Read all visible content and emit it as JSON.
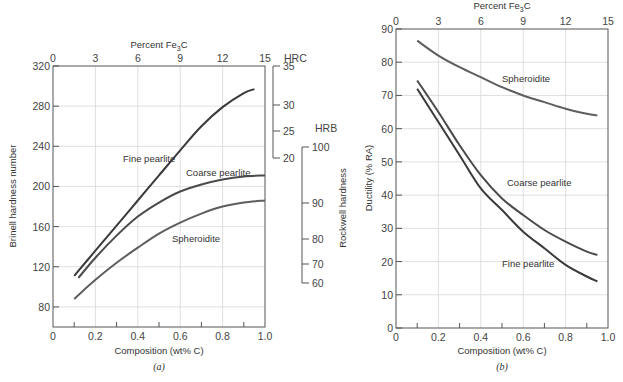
{
  "chart_data": [
    {
      "id": "a",
      "type": "line",
      "panel_label": "(a)",
      "title": "",
      "xlabel": "Composition (wt% C)",
      "ylabel": "Brinell hardness number",
      "top_xlabel": "Percent Fe3C",
      "right_ylabel": "Rockwell hardness",
      "xlim": [
        0,
        1.0
      ],
      "ylim": [
        60,
        320
      ],
      "x_ticks": [
        "0",
        "0.2",
        "0.4",
        "0.6",
        "0.8",
        "1.0"
      ],
      "y_ticks": [
        "80",
        "120",
        "160",
        "200",
        "240",
        "280",
        "320"
      ],
      "top_ticks": [
        "0",
        "3",
        "6",
        "9",
        "12",
        "15"
      ],
      "hrc_scale": {
        "label": "HRC",
        "ticks": [
          "35",
          "30",
          "25",
          "20"
        ]
      },
      "hrb_scale": {
        "label": "HRB",
        "ticks": [
          "100",
          "90",
          "80",
          "70",
          "60"
        ]
      },
      "grid": true,
      "series": [
        {
          "name": "Fine pearlite",
          "x": [
            0.1,
            0.2,
            0.3,
            0.4,
            0.5,
            0.6,
            0.7,
            0.8,
            0.9,
            0.95
          ],
          "values": [
            111,
            136,
            161,
            186,
            211,
            236,
            260,
            279,
            293,
            297
          ]
        },
        {
          "name": "Coarse pearlite",
          "x": [
            0.12,
            0.2,
            0.3,
            0.4,
            0.5,
            0.6,
            0.7,
            0.8,
            0.9,
            1.0
          ],
          "values": [
            109,
            129,
            151,
            170,
            184,
            195,
            202,
            207,
            210,
            211
          ]
        },
        {
          "name": "Spheroidite",
          "x": [
            0.1,
            0.2,
            0.3,
            0.4,
            0.5,
            0.6,
            0.7,
            0.8,
            0.9,
            1.0
          ],
          "values": [
            88,
            107,
            124,
            139,
            153,
            164,
            173,
            180,
            184,
            186
          ]
        }
      ]
    },
    {
      "id": "b",
      "type": "line",
      "panel_label": "(b)",
      "title": "",
      "xlabel": "Composition (wt% C)",
      "ylabel": "Ductility (% RA)",
      "top_xlabel": "Percent Fe3C",
      "xlim": [
        0,
        1.0
      ],
      "ylim": [
        0,
        90
      ],
      "x_ticks": [
        "0",
        "0.2",
        "0.4",
        "0.6",
        "0.8",
        "1.0"
      ],
      "y_ticks": [
        "0",
        "10",
        "20",
        "30",
        "40",
        "50",
        "60",
        "70",
        "80",
        "90"
      ],
      "top_ticks": [
        "0",
        "3",
        "6",
        "9",
        "12",
        "15"
      ],
      "grid": true,
      "series": [
        {
          "name": "Spheroidite",
          "x": [
            0.1,
            0.2,
            0.3,
            0.4,
            0.5,
            0.6,
            0.7,
            0.8,
            0.9,
            0.95
          ],
          "values": [
            86.5,
            82,
            78.5,
            75.5,
            72.5,
            70,
            68,
            66,
            64.5,
            64
          ]
        },
        {
          "name": "Coarse pearlite",
          "x": [
            0.1,
            0.2,
            0.3,
            0.4,
            0.5,
            0.6,
            0.7,
            0.8,
            0.9,
            0.95
          ],
          "values": [
            74.5,
            65,
            55,
            46,
            39,
            34,
            29.5,
            26,
            23,
            22
          ]
        },
        {
          "name": "Fine pearlite",
          "x": [
            0.1,
            0.2,
            0.3,
            0.4,
            0.5,
            0.6,
            0.7,
            0.8,
            0.9,
            0.95
          ],
          "values": [
            72,
            62,
            52,
            42,
            35.5,
            29,
            24,
            19,
            15.5,
            14
          ]
        }
      ]
    }
  ],
  "labels": {
    "a_top": "Percent Fe",
    "a_top_sub": "3",
    "a_top_tail": "C",
    "b_top": "Percent Fe",
    "b_top_sub": "3",
    "b_top_tail": "C"
  },
  "colors": {
    "fine_pearlite": "#3a3a3a",
    "coarse_pearlite": "#4a4a4a",
    "spheroidite": "#5e5e5e"
  }
}
